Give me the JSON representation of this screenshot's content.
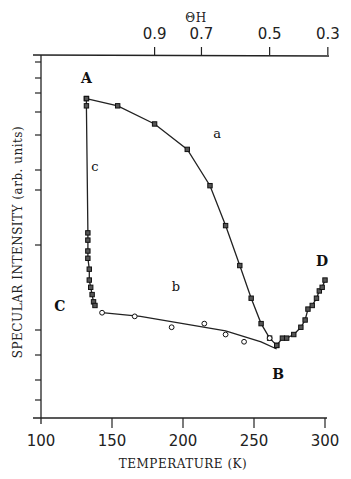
{
  "chart_data": {
    "type": "scatter",
    "title": "",
    "xlabel": "TEMPERATURE (K)",
    "ylabel": "SPECULAR INTENSITY (arb. units)",
    "top_axis_label": "ΘH",
    "x_ticks": [
      100,
      150,
      200,
      250,
      300
    ],
    "x_tick_labels": [
      "100",
      "150",
      "200",
      "250",
      "300"
    ],
    "top_ticks": [
      {
        "label": "0.9",
        "T": 180
      },
      {
        "label": "0.7",
        "T": 213
      },
      {
        "label": "0.5",
        "T": 261
      },
      {
        "label": "0.3",
        "T": 302
      }
    ],
    "xlim": [
      100,
      300
    ],
    "ylim": [
      0,
      100
    ],
    "grid": false,
    "legend": "none (curves labelled a, b, c; points A, B, C, D)",
    "point_labels": [
      {
        "text": "A",
        "T": 132,
        "y": 90
      },
      {
        "text": "B",
        "T": 267,
        "y": 20
      },
      {
        "text": "C",
        "T": 126,
        "y": 31
      },
      {
        "text": "D",
        "T": 298,
        "y": 39
      }
    ],
    "curve_labels": [
      {
        "text": "a",
        "T": 224,
        "y": 77
      },
      {
        "text": "b",
        "T": 195,
        "y": 35
      },
      {
        "text": "c",
        "T": 138,
        "y": 68
      }
    ],
    "series": [
      {
        "name": "a",
        "marker": "square",
        "x": [
          132,
          154,
          180,
          203,
          219,
          230,
          240,
          248,
          255,
          261,
          266
        ],
        "y": [
          88,
          86,
          81,
          74,
          64,
          53,
          42,
          33,
          26,
          22,
          20
        ]
      },
      {
        "name": "c",
        "marker": "square",
        "x": [
          132,
          132,
          133,
          133,
          133,
          133,
          134,
          134,
          135,
          136,
          137,
          138
        ],
        "y": [
          88,
          86,
          51,
          49,
          46,
          44,
          41,
          38,
          36,
          34,
          32,
          31
        ]
      },
      {
        "name": "b",
        "marker": "circle",
        "x": [
          143,
          166,
          192,
          215,
          230,
          243,
          261
        ],
        "y": [
          29,
          28,
          25,
          26,
          23,
          21,
          22
        ]
      },
      {
        "name": "b-fit-line",
        "marker": "none",
        "x": [
          143,
          170,
          200,
          230,
          255,
          266
        ],
        "y": [
          29,
          28,
          26,
          24,
          21,
          19
        ]
      },
      {
        "name": "d",
        "marker": "square",
        "x": [
          266,
          270,
          273,
          278,
          283,
          286,
          288,
          291,
          294,
          296,
          298,
          300
        ],
        "y": [
          20,
          22,
          22,
          23,
          25,
          27,
          30,
          31,
          33,
          35,
          36,
          38
        ]
      }
    ]
  }
}
